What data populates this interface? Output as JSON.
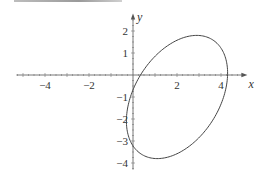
{
  "chart_data": {
    "type": "line",
    "title": "",
    "xlabel": "x",
    "ylabel": "y",
    "xlim": [
      -5.3,
      5.2
    ],
    "ylim": [
      -4.3,
      2.8
    ],
    "x_ticks": [
      -4,
      -2,
      2,
      4
    ],
    "y_ticks": [
      2,
      1,
      -1,
      -2,
      -3,
      -4
    ],
    "x_tick_labels": [
      "−4",
      "−2",
      "2",
      "4"
    ],
    "y_tick_labels": [
      "2",
      "1",
      "−1",
      "−2",
      "−3",
      "−4"
    ],
    "grid": false,
    "series": [
      {
        "name": "ellipse",
        "curve": "parametric",
        "center": [
          2,
          -1
        ],
        "x_amplitude": 2.3,
        "y_amplitude": 2.8,
        "phase": 0.4,
        "extremes": {
          "x_max": 4.3,
          "x_min": -0.3,
          "y_max": 1.8,
          "y_min": -3.8
        },
        "color": "#444444"
      }
    ]
  }
}
